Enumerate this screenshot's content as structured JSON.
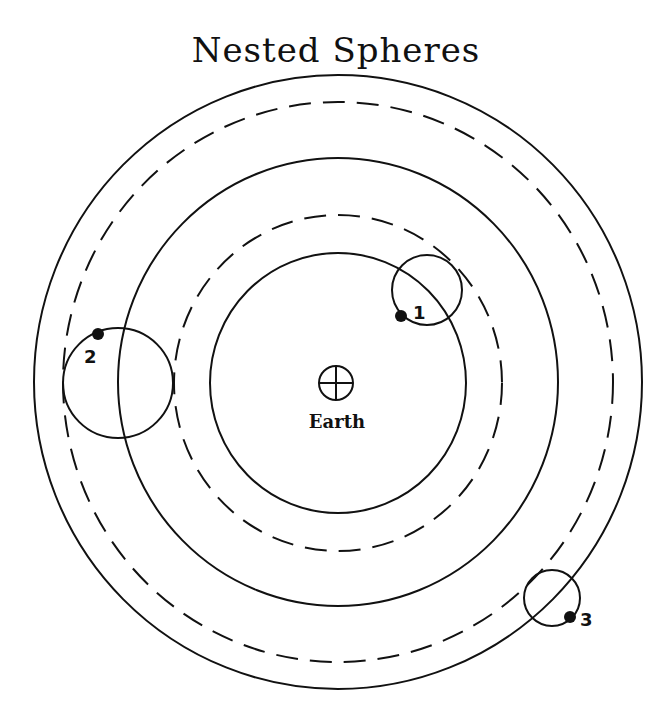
{
  "title": "Nested Spheres",
  "colors": {
    "stroke": "#111111",
    "background": "#ffffff"
  },
  "center": {
    "label": "Earth",
    "symbol": "earth-symbol (circle with cross)"
  },
  "spheres": [
    {
      "name": "inner-solid",
      "style": "solid"
    },
    {
      "name": "inner-dashed",
      "style": "dashed"
    },
    {
      "name": "middle-solid",
      "style": "solid"
    },
    {
      "name": "outer-dashed",
      "style": "dashed"
    },
    {
      "name": "outer-solid",
      "style": "solid"
    }
  ],
  "planets": [
    {
      "label": "1",
      "epicycle": "small circle on inner dashed sphere"
    },
    {
      "label": "2",
      "epicycle": "circle on middle sphere, left side"
    },
    {
      "label": "3",
      "epicycle": "small circle on outer dashed sphere, lower right"
    }
  ]
}
